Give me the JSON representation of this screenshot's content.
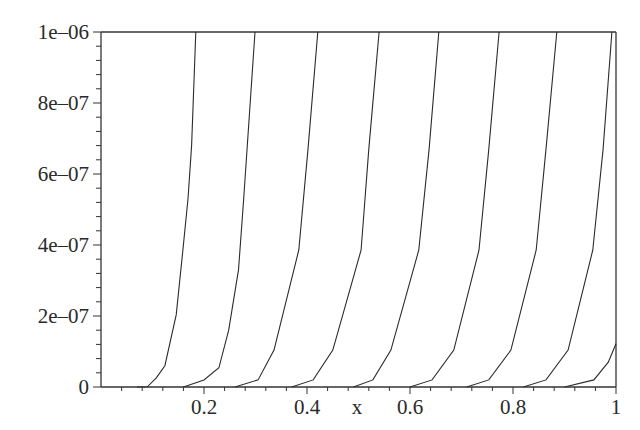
{
  "chart_data": {
    "type": "line",
    "title": "",
    "xlabel": "x",
    "ylabel": "",
    "xlim": [
      0,
      1
    ],
    "ylim": [
      0,
      1e-06
    ],
    "grid": false,
    "legend": null,
    "x_ticks": [
      {
        "value": 0.2,
        "label": "0.2"
      },
      {
        "value": 0.4,
        "label": "0.4"
      },
      {
        "value": 0.6,
        "label": "0.6"
      },
      {
        "value": 0.8,
        "label": "0.8"
      },
      {
        "value": 1,
        "label": "1"
      }
    ],
    "x_minor_step": 0.04,
    "y_ticks": [
      {
        "value": 0,
        "label": "0"
      },
      {
        "value": 2e-07,
        "label": "2e–07"
      },
      {
        "value": 4e-07,
        "label": "4e–07"
      },
      {
        "value": 6e-07,
        "label": "6e–07"
      },
      {
        "value": 8e-07,
        "label": "8e–07"
      },
      {
        "value": 1e-06,
        "label": "1e–06"
      }
    ],
    "y_minor_step": 4e-08,
    "series": [
      {
        "name": "curve-1",
        "points": [
          [
            0.07,
            0
          ],
          [
            0.09,
            5e-10
          ],
          [
            0.107,
            2.5e-08
          ],
          [
            0.124,
            6e-08
          ],
          [
            0.146,
            2.03e-07
          ],
          [
            0.159,
            3.86e-07
          ],
          [
            0.169,
            5.3e-07
          ],
          [
            0.176,
            6.8e-07
          ],
          [
            0.184,
            1e-06
          ]
        ]
      },
      {
        "name": "curve-2",
        "points": [
          [
            0.16,
            0
          ],
          [
            0.2,
            2e-08
          ],
          [
            0.229,
            5.4e-08
          ],
          [
            0.248,
            1.6e-07
          ],
          [
            0.267,
            3.3e-07
          ],
          [
            0.277,
            5.3e-07
          ],
          [
            0.299,
            1e-06
          ]
        ]
      },
      {
        "name": "curve-3",
        "points": [
          [
            0.26,
            0
          ],
          [
            0.305,
            2e-08
          ],
          [
            0.336,
            1.04e-07
          ],
          [
            0.384,
            3.86e-07
          ],
          [
            0.402,
            6.7e-07
          ],
          [
            0.421,
            1e-06
          ]
        ]
      },
      {
        "name": "curve-4",
        "points": [
          [
            0.37,
            0
          ],
          [
            0.412,
            2e-08
          ],
          [
            0.45,
            1.04e-07
          ],
          [
            0.505,
            3.86e-07
          ],
          [
            0.52,
            6.7e-07
          ],
          [
            0.54,
            1e-06
          ]
        ]
      },
      {
        "name": "curve-5",
        "points": [
          [
            0.49,
            0
          ],
          [
            0.528,
            2e-08
          ],
          [
            0.563,
            1.04e-07
          ],
          [
            0.617,
            3.86e-07
          ],
          [
            0.637,
            6.7e-07
          ],
          [
            0.656,
            1e-06
          ]
        ]
      },
      {
        "name": "curve-6",
        "points": [
          [
            0.6,
            0
          ],
          [
            0.643,
            2e-08
          ],
          [
            0.685,
            1.04e-07
          ],
          [
            0.734,
            3.86e-07
          ],
          [
            0.753,
            6.7e-07
          ],
          [
            0.773,
            1e-06
          ]
        ]
      },
      {
        "name": "curve-7",
        "points": [
          [
            0.71,
            0
          ],
          [
            0.753,
            2e-08
          ],
          [
            0.796,
            1.04e-07
          ],
          [
            0.845,
            3.86e-07
          ],
          [
            0.864,
            6.7e-07
          ],
          [
            0.885,
            1e-06
          ]
        ]
      },
      {
        "name": "curve-8",
        "points": [
          [
            0.82,
            0
          ],
          [
            0.864,
            2e-08
          ],
          [
            0.907,
            1.04e-07
          ],
          [
            0.955,
            3.86e-07
          ],
          [
            0.975,
            6.7e-07
          ],
          [
            0.992,
            1e-06
          ]
        ]
      },
      {
        "name": "curve-9",
        "points": [
          [
            0.9,
            0
          ],
          [
            0.957,
            2e-08
          ],
          [
            0.985,
            7e-08
          ],
          [
            1.0,
            1.22e-07
          ]
        ]
      }
    ],
    "colors": {
      "line": "#2b2b2b",
      "axis": "#333333",
      "background": "#ffffff"
    }
  }
}
